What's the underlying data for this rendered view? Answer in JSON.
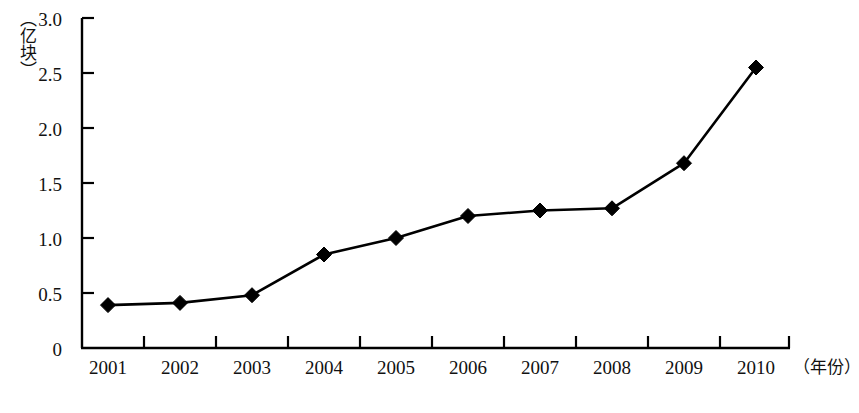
{
  "chart_data": {
    "type": "line",
    "title": "",
    "subtitle": "",
    "xlabel": "（年份）",
    "ylabel": "（亿块）",
    "categories": [
      "2001",
      "2002",
      "2003",
      "2004",
      "2005",
      "2006",
      "2007",
      "2008",
      "2009",
      "2010"
    ],
    "values": [
      0.39,
      0.41,
      0.48,
      0.85,
      1.0,
      1.2,
      1.25,
      1.27,
      1.68,
      2.55
    ],
    "series": [
      {
        "name": "产量",
        "values": [
          0.39,
          0.41,
          0.48,
          0.85,
          1.0,
          1.2,
          1.25,
          1.27,
          1.68,
          2.55
        ]
      }
    ],
    "ylim": [
      0,
      3.0
    ],
    "ytick_labels": [
      "0",
      "0.5",
      "1.0",
      "1.5",
      "2.0",
      "2.5",
      "3.0"
    ],
    "ytick_values": [
      0,
      0.5,
      1.0,
      1.5,
      2.0,
      2.5,
      3.0
    ],
    "xtick_labels": [
      "2001",
      "2002",
      "2003",
      "2004",
      "2005",
      "2006",
      "2007",
      "2008",
      "2009",
      "2010"
    ],
    "grid": false,
    "legend": "none",
    "marker": "diamond",
    "line_color": "#000000",
    "marker_color": "#000000",
    "axis_color": "#000000",
    "background_color": "#ffffff"
  },
  "axes": {
    "y_unit_label": "（亿块）",
    "x_unit_label": "（年份）",
    "y_ticks": [
      {
        "label": "3.0"
      },
      {
        "label": "2.5"
      },
      {
        "label": "2.0"
      },
      {
        "label": "1.5"
      },
      {
        "label": "1.0"
      },
      {
        "label": "0.5"
      },
      {
        "label": "0"
      }
    ],
    "x_ticks": [
      {
        "label": "2001"
      },
      {
        "label": "2002"
      },
      {
        "label": "2003"
      },
      {
        "label": "2004"
      },
      {
        "label": "2005"
      },
      {
        "label": "2006"
      },
      {
        "label": "2007"
      },
      {
        "label": "2008"
      },
      {
        "label": "2009"
      },
      {
        "label": "2010"
      }
    ]
  }
}
